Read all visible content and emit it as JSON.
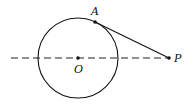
{
  "diagram": {
    "type": "geometry-tangent",
    "circle": {
      "center_label": "O",
      "cx": 78,
      "cy": 58,
      "r": 40
    },
    "points": [
      {
        "label": "A",
        "x": 95,
        "y": 22,
        "label_x": 91,
        "label_y": 15
      },
      {
        "label": "O",
        "x": 78,
        "y": 58,
        "label_x": 74,
        "label_y": 73
      },
      {
        "label": "P",
        "x": 169,
        "y": 58,
        "label_x": 174,
        "label_y": 62
      }
    ],
    "segments": [
      {
        "name": "tangent-AP",
        "from": "A",
        "to": "P",
        "style": "solid"
      },
      {
        "name": "line-OP",
        "x1": 11,
        "y1": 58,
        "x2": 169,
        "y2": 58,
        "style": "dashed"
      }
    ],
    "colors": {
      "stroke": "#111111",
      "background": "#ffffff"
    }
  }
}
